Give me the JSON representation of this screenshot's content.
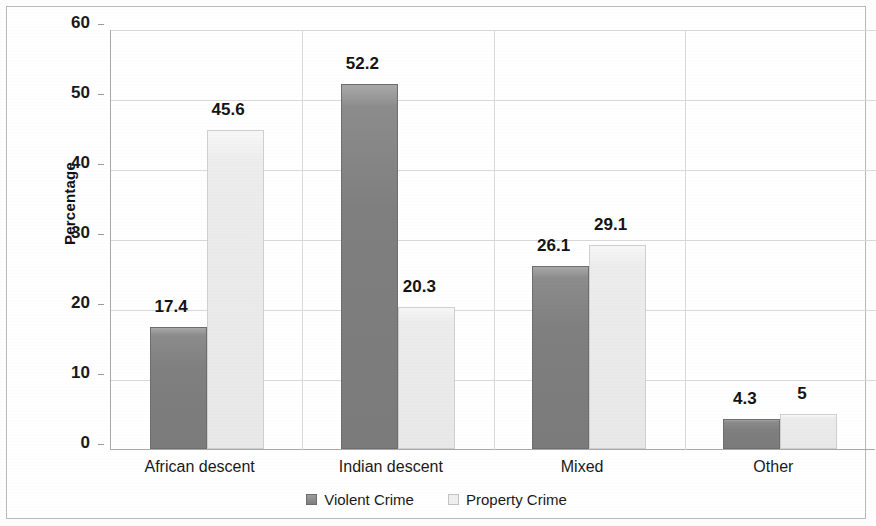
{
  "chart_data": {
    "type": "bar",
    "title": "",
    "xlabel": "",
    "ylabel": "Percentage",
    "ylim": [
      0,
      60
    ],
    "yticks": [
      0,
      10,
      20,
      30,
      40,
      50,
      60
    ],
    "ytick_labels": [
      "0",
      "10",
      "20",
      "30",
      "40",
      "50",
      "60"
    ],
    "grid": "horizontal-and-vertical",
    "legend_position": "bottom-center",
    "categories": [
      "African descent",
      "Indian descent",
      "Mixed",
      "Other"
    ],
    "series": [
      {
        "name": "Violent Crime",
        "color": "#7f7f7f",
        "values": [
          17.4,
          52.2,
          26.1,
          4.3
        ],
        "value_labels": [
          "17.4",
          "52.2",
          "26.1",
          "4.3"
        ]
      },
      {
        "name": "Property Crime",
        "color": "#ebebeb",
        "values": [
          45.6,
          20.3,
          29.1,
          5
        ],
        "value_labels": [
          "45.6",
          "20.3",
          "29.1",
          "5"
        ]
      }
    ]
  },
  "legend": {
    "items": [
      {
        "label": "Violent Crime",
        "swatch": "violent"
      },
      {
        "label": "Property Crime",
        "swatch": "property"
      }
    ]
  },
  "colors": {
    "violent_bar": "#7f7f7f",
    "property_bar": "#ebebeb",
    "gridline": "#d9d9d9",
    "axis": "#a8a8a8",
    "frame": "#b9b9b9",
    "text": "#1a1a1a"
  }
}
